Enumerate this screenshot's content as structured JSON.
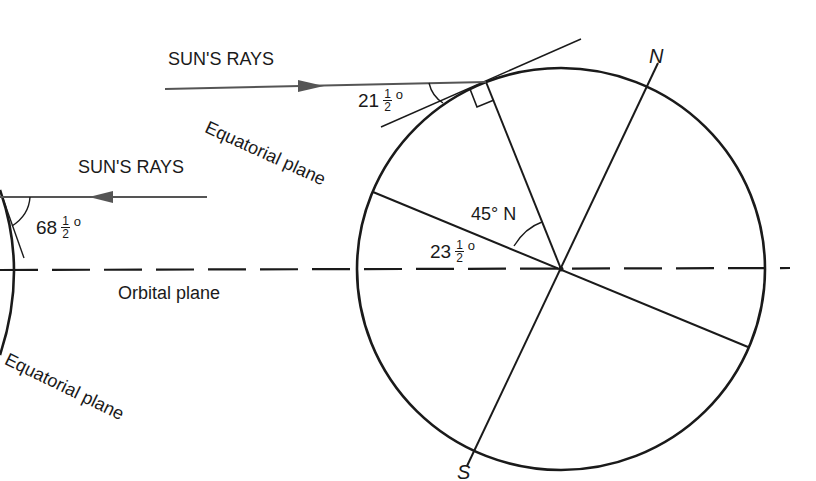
{
  "diagram": {
    "labels": {
      "sun_rays_upper": "SUN'S RAYS",
      "sun_rays_lower": "SUN'S RAYS",
      "equatorial_plane_upper": "Equatorial plane",
      "equatorial_plane_lower": "Equatorial plane",
      "orbital_plane": "Orbital plane",
      "north_pole": "N",
      "south_pole": "S",
      "latitude": "45° N"
    },
    "angles": {
      "incidence": {
        "whole": "21",
        "num": "1",
        "den": "2",
        "deg": "o"
      },
      "tilt": {
        "whole": "23",
        "num": "1",
        "den": "2",
        "deg": "o"
      },
      "left_sun_angle": {
        "whole": "68",
        "num": "1",
        "den": "2",
        "deg": "o"
      }
    },
    "colors": {
      "line": "#1a1a1a",
      "ray": "#555555",
      "background": "#ffffff"
    }
  }
}
